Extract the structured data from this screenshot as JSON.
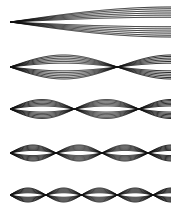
{
  "diagram": {
    "title": "",
    "canvas": {
      "width": 180,
      "height": 219,
      "background": "#ffffff"
    },
    "stroke_color": "#111111",
    "stroke_width": 0.9,
    "x_start": 10,
    "x_end": 171,
    "line_multipliers": [
      1.0,
      0.88,
      0.74,
      0.6,
      0.46,
      0.32
    ],
    "modes": [
      {
        "mode": 1,
        "center_y": 22,
        "amplitude": 15,
        "half_waves": 0.5,
        "nodes_x": [
          10
        ]
      },
      {
        "mode": 2,
        "center_y": 67,
        "amplitude": 12,
        "half_waves": 1.5,
        "nodes_x": [
          10,
          120
        ]
      },
      {
        "mode": 3,
        "center_y": 109,
        "amplitude": 9.5,
        "half_waves": 2.5,
        "nodes_x": [
          10,
          77,
          144
        ]
      },
      {
        "mode": 4,
        "center_y": 153,
        "amplitude": 8,
        "half_waves": 3.5,
        "nodes_x": [
          10,
          56,
          103,
          153
        ]
      },
      {
        "mode": 5,
        "center_y": 195,
        "amplitude": 7,
        "half_waves": 4.5,
        "nodes_x": [
          10,
          47,
          84,
          121,
          158
        ]
      }
    ]
  }
}
